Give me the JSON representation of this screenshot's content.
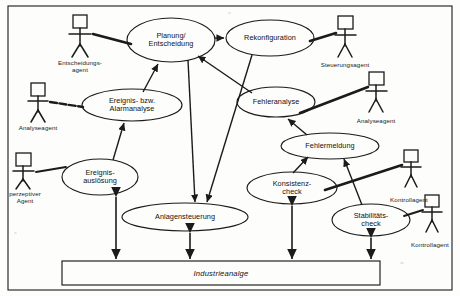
{
  "diagram": {
    "frame": {
      "x": 8,
      "y": 6,
      "w": 444,
      "h": 284
    },
    "colors": {
      "stroke": "#1b1b1b",
      "background": "#fdfdfb",
      "text": "#111111"
    }
  },
  "use_cases": [
    {
      "id": "planung",
      "label": "Planung/\nEntscheidung",
      "cx": 171,
      "cy": 40,
      "rx": 44,
      "ry": 22
    },
    {
      "id": "rekonfiguration",
      "label": "Rekonfiguration",
      "cx": 270,
      "cy": 38,
      "rx": 44,
      "ry": 18
    },
    {
      "id": "alarmanalyse",
      "label": "Ereignis- bzw.\nAlarmanalyse",
      "cx": 132,
      "cy": 105,
      "rx": 50,
      "ry": 16
    },
    {
      "id": "fehleranalyse",
      "label": "Fehleranalyse",
      "cx": 276,
      "cy": 102,
      "rx": 39,
      "ry": 15
    },
    {
      "id": "fehlermeldung",
      "label": "Fehlermeldung",
      "cx": 330,
      "cy": 146,
      "rx": 49,
      "ry": 13
    },
    {
      "id": "ausloesung",
      "label": "Ereignis-\nauslösung",
      "cx": 100,
      "cy": 177,
      "rx": 38,
      "ry": 18
    },
    {
      "id": "konsistenz",
      "label": "Konsistenz-\ncheck",
      "cx": 292,
      "cy": 188,
      "rx": 45,
      "ry": 16
    },
    {
      "id": "anlagensteuerung",
      "label": "Anlagensteuerung",
      "cx": 185,
      "cy": 217,
      "rx": 63,
      "ry": 14
    },
    {
      "id": "stabilitaet",
      "label": "Stabilitäts-\ncheck",
      "cx": 371,
      "cy": 220,
      "rx": 39,
      "ry": 16
    }
  ],
  "actors": [
    {
      "id": "entscheidungsagent",
      "label": "Entscheidungs-\nagent",
      "x": 80,
      "y": 16,
      "label_y": 59
    },
    {
      "id": "analyseagent-left",
      "label": "Analyseagent",
      "x": 38,
      "y": 84,
      "label_y": 124
    },
    {
      "id": "perzeptiver-agent",
      "label": "perzeptiver\nAgent",
      "x": 23,
      "y": 154,
      "label_y": 190
    },
    {
      "id": "steuerungsagent",
      "label": "Steuerungsagent",
      "x": 345,
      "y": 17,
      "label_y": 61
    },
    {
      "id": "analyseagent-right",
      "label": "Analyseagent",
      "x": 376,
      "y": 73,
      "label_y": 117
    },
    {
      "id": "kontrollagent-upper",
      "label": "Kontrollagent",
      "x": 411,
      "y": 151,
      "label_y": 196
    },
    {
      "id": "kontrollagent-lower",
      "label": "Kontrollagent",
      "x": 432,
      "y": 196,
      "label_y": 241
    }
  ],
  "system_box": {
    "label": "Industrieanalge",
    "x": 62,
    "y": 261,
    "w": 318,
    "h": 24
  },
  "associations": [
    {
      "from": "entscheidungsagent",
      "to": "planung",
      "type": "association"
    },
    {
      "from": "analyseagent-left",
      "to": "alarmanalyse",
      "type": "association"
    },
    {
      "from": "perzeptiver-agent",
      "to": "ausloesung",
      "type": "association"
    },
    {
      "from": "steuerungsagent",
      "to": "rekonfiguration",
      "type": "association"
    },
    {
      "from": "analyseagent-right",
      "to": "fehleranalyse",
      "type": "association"
    },
    {
      "from": "kontrollagent-upper",
      "to": "konsistenz",
      "type": "association"
    },
    {
      "from": "kontrollagent-lower",
      "to": "stabilitaet",
      "type": "association"
    },
    {
      "from": "planung",
      "to": "rekonfiguration",
      "type": "arrow"
    },
    {
      "from": "alarmanalyse",
      "to": "planung",
      "type": "arrow"
    },
    {
      "from": "fehleranalyse",
      "to": "planung",
      "type": "arrow"
    },
    {
      "from": "ausloesung",
      "to": "alarmanalyse",
      "type": "arrow"
    },
    {
      "from": "fehlermeldung",
      "to": "fehleranalyse",
      "type": "arrow"
    },
    {
      "from": "konsistenz",
      "to": "fehlermeldung",
      "type": "arrow"
    },
    {
      "from": "stabilitaet",
      "to": "fehlermeldung",
      "type": "arrow"
    },
    {
      "from": "planung",
      "to": "anlagensteuerung",
      "type": "arrow"
    },
    {
      "from": "rekonfiguration",
      "to": "anlagensteuerung",
      "type": "arrow"
    },
    {
      "from": "ausloesung",
      "to": "system_box",
      "type": "double-arrow"
    },
    {
      "from": "anlagensteuerung",
      "to": "system_box",
      "type": "double-arrow"
    },
    {
      "from": "konsistenz",
      "to": "system_box",
      "type": "double-arrow"
    },
    {
      "from": "stabilitaet",
      "to": "system_box",
      "type": "double-arrow"
    }
  ]
}
